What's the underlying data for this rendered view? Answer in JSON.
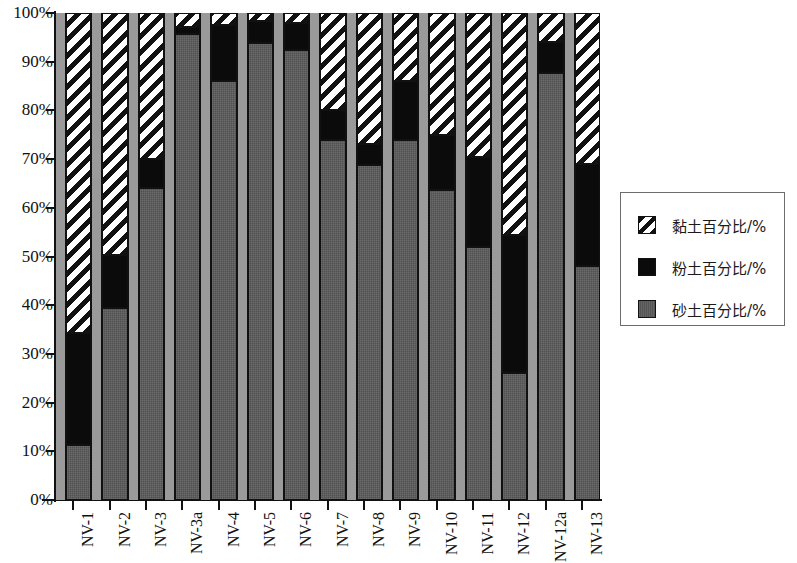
{
  "chart_data": {
    "type": "bar",
    "subtype": "stacked-100-percent",
    "title": "",
    "xlabel": "",
    "ylabel": "",
    "ylim": [
      0,
      100
    ],
    "ytick_labels": [
      "0%",
      "10%",
      "20%",
      "30%",
      "40%",
      "50%",
      "60%",
      "70%",
      "80%",
      "90%",
      "100%"
    ],
    "ytick_values": [
      0,
      10,
      20,
      30,
      40,
      50,
      60,
      70,
      80,
      90,
      100
    ],
    "grid": false,
    "legend_position": "right",
    "categories": [
      "NV-1",
      "NV-2",
      "NV-3",
      "NV-3a",
      "NV-4",
      "NV-5",
      "NV-6",
      "NV-7",
      "NV-8",
      "NV-9",
      "NV-10",
      "NV-11",
      "NV-12",
      "NV-12a",
      "NV-13"
    ],
    "series": [
      {
        "name": "砂土百分比/%",
        "key": "sand",
        "color": "#5a5a5a",
        "pattern": "solid-gray",
        "values": [
          11.3,
          39.4,
          64.0,
          95.6,
          86.0,
          93.8,
          92.4,
          74.0,
          68.8,
          74.0,
          63.7,
          52.0,
          26.0,
          87.7,
          48.0
        ]
      },
      {
        "name": "粉土百分比/%",
        "key": "silt",
        "color": "#0b0b0b",
        "pattern": "solid-black",
        "values": [
          23.0,
          11.0,
          6.0,
          1.5,
          11.5,
          4.5,
          5.5,
          6.0,
          4.2,
          12.0,
          11.3,
          18.5,
          28.5,
          6.3,
          21.0
        ]
      },
      {
        "name": "黏土百分比/%",
        "key": "clay",
        "color": "#ffffff",
        "pattern": "diagonal-hatch",
        "values": [
          65.7,
          49.6,
          30.0,
          2.9,
          2.5,
          1.7,
          2.1,
          20.0,
          27.0,
          14.0,
          25.0,
          29.5,
          45.5,
          6.0,
          31.0
        ]
      }
    ],
    "cumulative_tops": {
      "sand": [
        11.3,
        39.4,
        64.0,
        95.6,
        86.0,
        93.8,
        92.4,
        74.0,
        68.8,
        74.0,
        63.7,
        52.0,
        26.0,
        87.7,
        48.0
      ],
      "silt": [
        34.3,
        50.4,
        70.0,
        97.1,
        97.5,
        98.3,
        97.9,
        80.0,
        73.0,
        86.0,
        75.0,
        70.5,
        54.5,
        94.0,
        69.0
      ],
      "clay": [
        100,
        100,
        100,
        100,
        100,
        100,
        100,
        100,
        100,
        100,
        100,
        100,
        100,
        100,
        100
      ]
    }
  },
  "legend": {
    "items": [
      {
        "label": "黏土百分比/%",
        "swatch": "clay-hatch-swatch"
      },
      {
        "label": "粉土百分比/%",
        "swatch": "silt-black-swatch"
      },
      {
        "label": "砂土百分比/%",
        "swatch": "sand-gray-swatch"
      }
    ]
  }
}
